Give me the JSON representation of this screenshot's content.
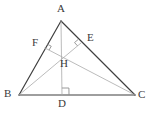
{
  "figure": {
    "width": 150,
    "height": 115,
    "background_color": "#ffffff",
    "side_stroke_color": "#3f3f3f",
    "altitude_stroke_color": "#a9a9a9",
    "right_angle_color": "#8f8f8f",
    "label_color": "#3a3a3a"
  },
  "points": {
    "A": {
      "label": "A",
      "x": 61,
      "y": 21,
      "label_x": 57,
      "label_y": 3
    },
    "B": {
      "label": "B",
      "x": 19,
      "y": 95,
      "label_x": 4,
      "label_y": 88
    },
    "C": {
      "label": "C",
      "x": 135,
      "y": 95,
      "label_x": 138,
      "label_y": 89
    },
    "D": {
      "label": "D",
      "x": 62,
      "y": 95,
      "label_x": 58,
      "label_y": 98
    },
    "E": {
      "label": "E",
      "x": 81,
      "y": 43,
      "label_x": 87,
      "label_y": 32
    },
    "F": {
      "label": "F",
      "x": 45,
      "y": 48,
      "label_x": 32,
      "label_y": 37
    },
    "H": {
      "label": "H",
      "x": 62,
      "y": 57,
      "label_x": 60,
      "label_y": 58
    }
  },
  "segments": [
    {
      "name": "side-ab",
      "from": "A",
      "to": "B",
      "style": "side"
    },
    {
      "name": "side-ac",
      "from": "A",
      "to": "C",
      "style": "side"
    },
    {
      "name": "side-bc",
      "from": "B",
      "to": "C",
      "style": "side"
    },
    {
      "name": "altitude-ad",
      "from": "A",
      "to": "D",
      "style": "altitude"
    },
    {
      "name": "altitude-be",
      "from": "B",
      "to": "E",
      "style": "altitude"
    },
    {
      "name": "altitude-cf",
      "from": "C",
      "to": "F",
      "style": "altitude"
    }
  ],
  "right_angles": [
    {
      "name": "right-angle-at-d",
      "at": "D"
    },
    {
      "name": "right-angle-at-e",
      "at": "E"
    },
    {
      "name": "right-angle-at-f",
      "at": "F"
    }
  ]
}
